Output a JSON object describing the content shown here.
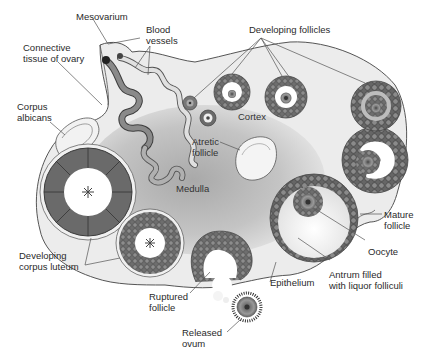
{
  "diagram": {
    "colors": {
      "outline": "#555555",
      "cortex_fill": "#ececec",
      "medulla_fill": "#b8b8b8",
      "follicle_dark": "#5a5a5a",
      "follicle_mid": "#8a8a8a",
      "corpus_luteum": "#6a6a6a",
      "vessel_dark": "#7a7a7a",
      "vessel_light": "#d8d8d8",
      "label_text": "#2a2a2a"
    },
    "labels": {
      "mesovarium": "Mesovarium",
      "blood_vessels": "Blood\nvessels",
      "developing_follicles": "Developing follicles",
      "connective_tissue": "Connective\ntissue of ovary",
      "corpus_albicans": "Corpus\nalbicans",
      "cortex": "Cortex",
      "atretic_follicle": "Atretic\nfollicle",
      "medulla": "Medulla",
      "mature_follicle": "Mature\nfollicle",
      "oocyte": "Oocyte",
      "developing_corpus_luteum": "Developing\ncorpus luteum",
      "epithelium": "Epithelium",
      "antrum": "Antrum filled\nwith liquor folliculi",
      "ruptured_follicle": "Ruptured\nfollicle",
      "released_ovum": "Released\novum"
    }
  }
}
